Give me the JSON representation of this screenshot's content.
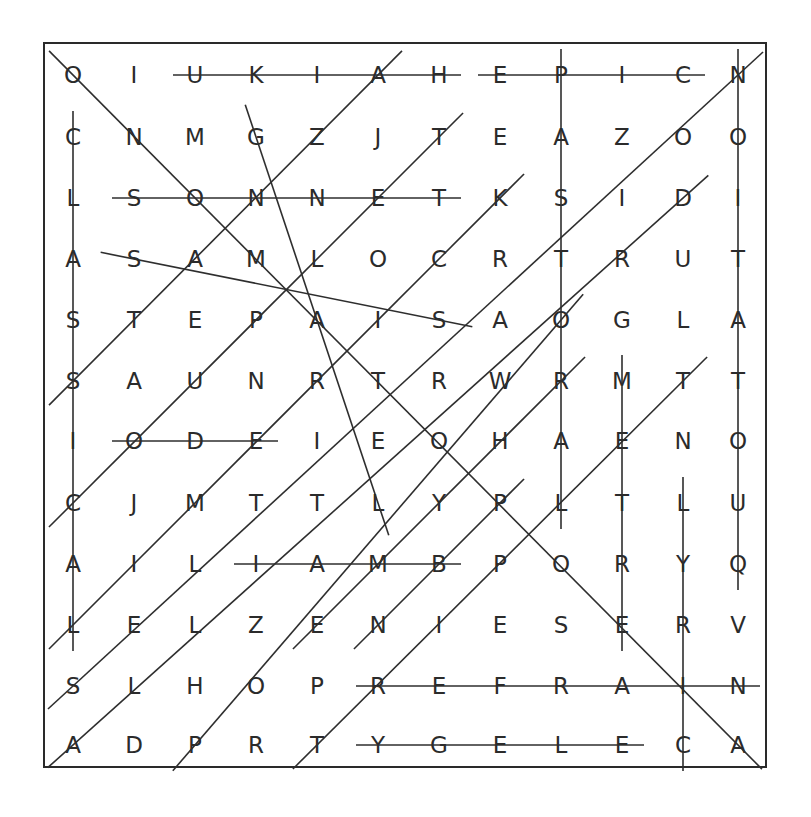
{
  "puzzle": {
    "type": "word-search",
    "rows": 12,
    "cols": 12,
    "grid": [
      [
        "O",
        "I",
        "U",
        "K",
        "I",
        "A",
        "H",
        "E",
        "P",
        "I",
        "C",
        "N"
      ],
      [
        "C",
        "N",
        "M",
        "G",
        "Z",
        "J",
        "T",
        "E",
        "A",
        "Z",
        "O",
        "O"
      ],
      [
        "L",
        "S",
        "O",
        "N",
        "N",
        "E",
        "T",
        "K",
        "S",
        "I",
        "D",
        "I"
      ],
      [
        "A",
        "S",
        "A",
        "M",
        "L",
        "O",
        "C",
        "R",
        "T",
        "R",
        "U",
        "T"
      ],
      [
        "S",
        "T",
        "E",
        "P",
        "A",
        "I",
        "S",
        "A",
        "O",
        "G",
        "L",
        "A"
      ],
      [
        "S",
        "A",
        "U",
        "N",
        "R",
        "T",
        "R",
        "W",
        "R",
        "M",
        "T",
        "T"
      ],
      [
        "I",
        "O",
        "D",
        "E",
        "I",
        "E",
        "O",
        "H",
        "A",
        "E",
        "N",
        "O"
      ],
      [
        "C",
        "J",
        "M",
        "T",
        "T",
        "L",
        "Y",
        "P",
        "L",
        "T",
        "L",
        "U"
      ],
      [
        "A",
        "I",
        "L",
        "I",
        "A",
        "M",
        "B",
        "P",
        "O",
        "R",
        "Y",
        "Q"
      ],
      [
        "L",
        "E",
        "L",
        "Z",
        "E",
        "N",
        "I",
        "E",
        "S",
        "E",
        "R",
        "V"
      ],
      [
        "S",
        "L",
        "H",
        "O",
        "P",
        "R",
        "E",
        "F",
        "R",
        "A",
        "I",
        "N"
      ],
      [
        "A",
        "D",
        "P",
        "R",
        "T",
        "Y",
        "G",
        "E",
        "L",
        "E",
        "C",
        "A"
      ]
    ],
    "found_lines": [
      {
        "dir": "horizontal",
        "from": [
          0,
          2
        ],
        "to": [
          0,
          6
        ]
      },
      {
        "dir": "horizontal",
        "from": [
          0,
          7
        ],
        "to": [
          0,
          10
        ]
      },
      {
        "dir": "horizontal",
        "from": [
          2,
          1
        ],
        "to": [
          2,
          6
        ]
      },
      {
        "dir": "horizontal",
        "from": [
          6,
          1
        ],
        "to": [
          6,
          3
        ]
      },
      {
        "dir": "horizontal",
        "from": [
          8,
          3
        ],
        "to": [
          8,
          6
        ]
      },
      {
        "dir": "horizontal",
        "from": [
          10,
          5
        ],
        "to": [
          10,
          11
        ]
      },
      {
        "dir": "horizontal",
        "from": [
          11,
          5
        ],
        "to": [
          11,
          9
        ]
      },
      {
        "dir": "vertical",
        "from": [
          0,
          8
        ],
        "to": [
          7,
          8
        ]
      },
      {
        "dir": "vertical",
        "from": [
          0,
          11
        ],
        "to": [
          8,
          11
        ]
      },
      {
        "dir": "vertical",
        "from": [
          1,
          0
        ],
        "to": [
          9,
          0
        ]
      },
      {
        "dir": "vertical",
        "from": [
          5,
          9
        ],
        "to": [
          9,
          9
        ]
      },
      {
        "dir": "vertical",
        "from": [
          7,
          10
        ],
        "to": [
          11,
          10
        ]
      },
      {
        "dir": "diag-down",
        "from": [
          0,
          0
        ],
        "to": [
          11,
          11
        ]
      },
      {
        "dir": "diag-down",
        "from": [
          1,
          3
        ],
        "to": [
          7,
          5
        ]
      },
      {
        "dir": "diag-down",
        "from": [
          3,
          1
        ],
        "to": [
          4,
          6
        ]
      },
      {
        "dir": "diag-up",
        "from": [
          5,
          0
        ],
        "to": [
          0,
          5
        ]
      },
      {
        "dir": "diag-up",
        "from": [
          7,
          0
        ],
        "to": [
          1,
          6
        ]
      },
      {
        "dir": "diag-up",
        "from": [
          9,
          0
        ],
        "to": [
          2,
          7
        ]
      },
      {
        "dir": "diag-up",
        "from": [
          10,
          0
        ],
        "to": [
          0,
          11
        ]
      },
      {
        "dir": "diag-up",
        "from": [
          11,
          0
        ],
        "to": [
          2,
          10
        ]
      },
      {
        "dir": "diag-up",
        "from": [
          11,
          2
        ],
        "to": [
          4,
          8
        ]
      },
      {
        "dir": "diag-up",
        "from": [
          9,
          4
        ],
        "to": [
          5,
          8
        ]
      },
      {
        "dir": "diag-up",
        "from": [
          11,
          4
        ],
        "to": [
          5,
          10
        ]
      },
      {
        "dir": "diag-up",
        "from": [
          9,
          5
        ],
        "to": [
          7,
          7
        ]
      }
    ]
  }
}
